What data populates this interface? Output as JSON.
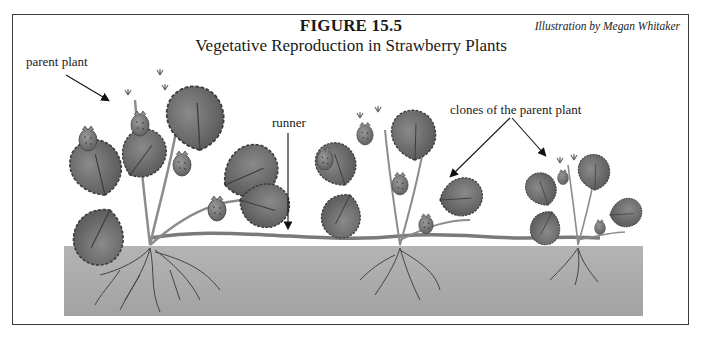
{
  "figure": {
    "number_label": "FIGURE 15.5",
    "title": "Vegetative Reproduction in Strawberry Plants",
    "credit": "Illustration by Megan Whitaker"
  },
  "labels": {
    "parent": "parent plant",
    "runner": "runner",
    "clones": "clones of the parent plant"
  },
  "illustration": {
    "plants": [
      {
        "role": "parent",
        "size": "large"
      },
      {
        "role": "clone",
        "size": "medium"
      },
      {
        "role": "clone",
        "size": "small"
      }
    ],
    "colors": {
      "soil": "#a6a6a6",
      "leaf": "#6e6e6e",
      "leaf_dark": "#4a4a4a",
      "stem": "#8c8c8c",
      "berry": "#7a7a7a",
      "root": "#444444",
      "frame": "#3a3a3a"
    }
  }
}
